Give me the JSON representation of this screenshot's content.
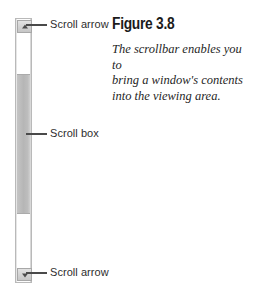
{
  "figure": {
    "heading": "Figure 3.8",
    "caption_lines": [
      "The scrollbar enables you to",
      "bring a window's contents",
      "into the viewing area."
    ]
  },
  "scrollbar": {
    "top_arrow": {
      "label": "Scroll arrow",
      "icon": "triangle-up-icon"
    },
    "scroll_box": {
      "label": "Scroll box"
    },
    "bottom_arrow": {
      "label": "Scroll arrow",
      "icon": "triangle-down-icon"
    },
    "orientation": "vertical"
  },
  "colors": {
    "page_background": "#ffffff",
    "scrollbar_frame": "#b9b9b9",
    "scrollbar_track": "#ffffff",
    "scroll_box_fill": "#b6b6b6",
    "arrow_button_fill": "#d2d2d2",
    "arrow_glyph": "#4c4c4c",
    "leader_line": "#4a4a4a",
    "label_text": "#2e2e2e",
    "heading_text": "#1b1b1b",
    "caption_text": "#1f1f1f"
  }
}
